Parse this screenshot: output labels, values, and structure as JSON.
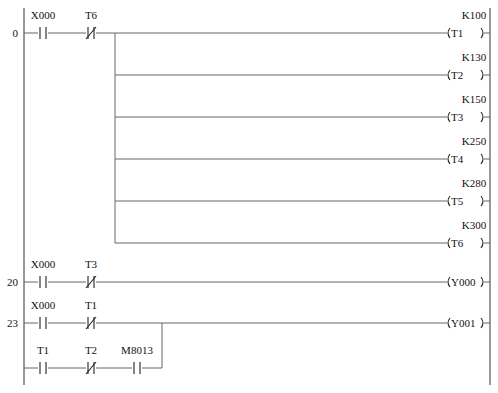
{
  "rails": {
    "left_x": 24,
    "right_x": 490,
    "top_y": 8,
    "bottom_y": 385
  },
  "rungs": [
    {
      "step": "0",
      "y": 33,
      "contacts": [
        {
          "label": "X000",
          "type": "NO",
          "x": 43
        },
        {
          "label": "T6",
          "type": "NC",
          "x": 91
        }
      ],
      "branch_x": 115,
      "coils": [
        {
          "name": "T1",
          "preset": "K100",
          "y": 33
        },
        {
          "name": "T2",
          "preset": "K130",
          "y": 75
        },
        {
          "name": "T3",
          "preset": "K150",
          "y": 117
        },
        {
          "name": "T4",
          "preset": "K250",
          "y": 159
        },
        {
          "name": "T5",
          "preset": "K280",
          "y": 201
        },
        {
          "name": "T6",
          "preset": "K300",
          "y": 243
        }
      ]
    },
    {
      "step": "20",
      "y": 282,
      "contacts": [
        {
          "label": "X000",
          "type": "NO",
          "x": 43
        },
        {
          "label": "T3",
          "type": "NC",
          "x": 91
        }
      ],
      "coils": [
        {
          "name": "Y000",
          "preset": "",
          "y": 282
        }
      ]
    },
    {
      "step": "23",
      "y": 323,
      "contacts": [
        {
          "label": "X000",
          "type": "NO",
          "x": 43
        },
        {
          "label": "T1",
          "type": "NC",
          "x": 91
        }
      ],
      "parallel_branch": {
        "y": 368,
        "join_x": 162,
        "contacts": [
          {
            "label": "T1",
            "type": "NO",
            "x": 43
          },
          {
            "label": "T2",
            "type": "NC",
            "x": 91
          },
          {
            "label": "M8013",
            "type": "NO",
            "x": 137
          }
        ]
      },
      "coils": [
        {
          "name": "Y001",
          "preset": "",
          "y": 323
        }
      ]
    }
  ],
  "coil_layout": {
    "open_x": 447,
    "close_x": 484
  }
}
